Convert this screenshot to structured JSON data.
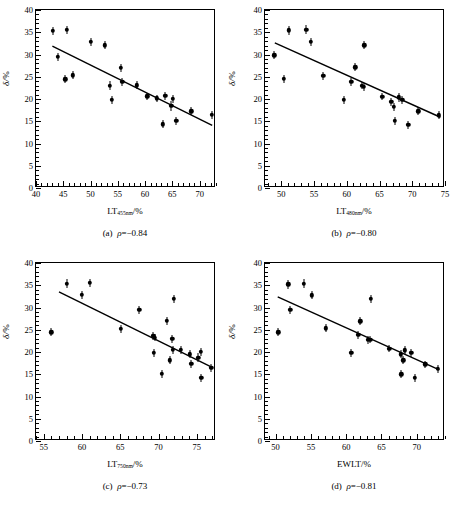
{
  "figure": {
    "type": "scatter-matrix",
    "panel_count": 4,
    "y_axis_label": "δ/",
    "y_axis_unit": "%"
  },
  "chart_data": [
    {
      "type": "scatter",
      "panel": "a",
      "title": "(a)",
      "caption_rho": "ρ",
      "caption_value": "=−0.84",
      "rho": -0.84,
      "xlabel_main": "LT",
      "xlabel_sub": "455nm",
      "xlabel_unit": "/%",
      "ylabel": "δ/%",
      "xlim": [
        40,
        73
      ],
      "ylim": [
        0,
        40
      ],
      "xticks": [
        40,
        45,
        50,
        55,
        60,
        65,
        70
      ],
      "yticks": [
        0,
        5,
        10,
        15,
        20,
        25,
        30,
        35,
        40
      ],
      "xminor_step": 1,
      "yminor_step": 1,
      "grid": false,
      "legend": "none",
      "fit_line": {
        "x1": 43.0,
        "y1": 31.9,
        "x2": 72.3,
        "y2": 14.1
      },
      "points": [
        {
          "x": 43.1,
          "y": 35.3,
          "err": 0.9
        },
        {
          "x": 44.0,
          "y": 29.5,
          "err": 0.9
        },
        {
          "x": 45.4,
          "y": 24.4,
          "err": 0.9
        },
        {
          "x": 45.6,
          "y": 35.5,
          "err": 1.0
        },
        {
          "x": 46.8,
          "y": 25.3,
          "err": 0.9
        },
        {
          "x": 50.0,
          "y": 32.9,
          "err": 0.9
        },
        {
          "x": 52.6,
          "y": 32.1,
          "err": 0.9
        },
        {
          "x": 53.5,
          "y": 23.0,
          "err": 1.0
        },
        {
          "x": 53.9,
          "y": 19.8,
          "err": 0.9
        },
        {
          "x": 55.6,
          "y": 27.0,
          "err": 0.9
        },
        {
          "x": 55.8,
          "y": 23.8,
          "err": 0.9
        },
        {
          "x": 58.5,
          "y": 23.1,
          "err": 0.9
        },
        {
          "x": 60.4,
          "y": 20.6,
          "err": 0.8
        },
        {
          "x": 62.2,
          "y": 20.2,
          "err": 0.8
        },
        {
          "x": 63.3,
          "y": 14.3,
          "err": 0.9
        },
        {
          "x": 63.7,
          "y": 20.7,
          "err": 0.9
        },
        {
          "x": 64.8,
          "y": 18.5,
          "err": 1.1
        },
        {
          "x": 65.1,
          "y": 20.0,
          "err": 0.9
        },
        {
          "x": 65.7,
          "y": 15.1,
          "err": 0.9
        },
        {
          "x": 68.5,
          "y": 17.2,
          "err": 0.9
        },
        {
          "x": 72.2,
          "y": 16.4,
          "err": 0.9
        }
      ]
    },
    {
      "type": "scatter",
      "panel": "b",
      "title": "(b)",
      "caption_rho": "ρ",
      "caption_value": "=−0.80",
      "rho": -0.8,
      "xlabel_main": "LT",
      "xlabel_sub": "480nm",
      "xlabel_unit": "/%",
      "ylabel": "δ/%",
      "xlim": [
        47.5,
        75
      ],
      "ylim": [
        0,
        40
      ],
      "xticks": [
        50,
        55,
        60,
        65,
        70,
        75
      ],
      "yticks": [
        0,
        5,
        10,
        15,
        20,
        25,
        30,
        35,
        40
      ],
      "xminor_step": 1,
      "yminor_step": 1,
      "grid": false,
      "legend": "none",
      "fit_line": {
        "x1": 49.0,
        "y1": 32.6,
        "x2": 74.3,
        "y2": 15.9
      },
      "points": [
        {
          "x": 48.9,
          "y": 29.8,
          "err": 0.9
        },
        {
          "x": 50.4,
          "y": 24.5,
          "err": 0.9
        },
        {
          "x": 51.1,
          "y": 35.4,
          "err": 1.0
        },
        {
          "x": 53.8,
          "y": 35.6,
          "err": 1.0
        },
        {
          "x": 54.5,
          "y": 32.8,
          "err": 0.9
        },
        {
          "x": 56.4,
          "y": 25.2,
          "err": 0.9
        },
        {
          "x": 59.5,
          "y": 19.8,
          "err": 0.9
        },
        {
          "x": 60.7,
          "y": 23.9,
          "err": 0.9
        },
        {
          "x": 61.3,
          "y": 27.1,
          "err": 0.9
        },
        {
          "x": 62.3,
          "y": 23.0,
          "err": 0.8
        },
        {
          "x": 62.6,
          "y": 22.7,
          "err": 0.9
        },
        {
          "x": 62.7,
          "y": 32.1,
          "err": 0.9
        },
        {
          "x": 65.4,
          "y": 20.5,
          "err": 0.8
        },
        {
          "x": 66.8,
          "y": 19.4,
          "err": 0.9
        },
        {
          "x": 67.2,
          "y": 18.2,
          "err": 0.9
        },
        {
          "x": 67.3,
          "y": 15.1,
          "err": 0.9
        },
        {
          "x": 67.9,
          "y": 20.4,
          "err": 1.0
        },
        {
          "x": 68.5,
          "y": 19.8,
          "err": 0.9
        },
        {
          "x": 69.4,
          "y": 14.2,
          "err": 0.9
        },
        {
          "x": 70.9,
          "y": 17.2,
          "err": 0.9
        },
        {
          "x": 74.1,
          "y": 16.3,
          "err": 0.9
        }
      ]
    },
    {
      "type": "scatter",
      "panel": "c",
      "title": "(c)",
      "caption_rho": "ρ",
      "caption_value": "=−0.73",
      "rho": -0.73,
      "xlabel_main": "LT",
      "xlabel_sub": "750nm",
      "xlabel_unit": "/%",
      "ylabel": "δ/%",
      "xlim": [
        54,
        77.5
      ],
      "ylim": [
        0,
        40
      ],
      "xticks": [
        55,
        60,
        65,
        70,
        75
      ],
      "yticks": [
        0,
        5,
        10,
        15,
        20,
        25,
        30,
        35,
        40
      ],
      "xminor_step": 1,
      "yminor_step": 1,
      "grid": false,
      "legend": "none",
      "fit_line": {
        "x1": 57.0,
        "y1": 33.5,
        "x2": 76.8,
        "y2": 16.7
      },
      "points": [
        {
          "x": 56.0,
          "y": 24.4,
          "err": 0.9
        },
        {
          "x": 58.0,
          "y": 35.3,
          "err": 1.0
        },
        {
          "x": 60.0,
          "y": 32.8,
          "err": 0.9
        },
        {
          "x": 61.0,
          "y": 35.5,
          "err": 1.0
        },
        {
          "x": 65.1,
          "y": 25.2,
          "err": 0.9
        },
        {
          "x": 67.5,
          "y": 29.5,
          "err": 0.9
        },
        {
          "x": 69.3,
          "y": 23.6,
          "err": 1.0
        },
        {
          "x": 69.4,
          "y": 19.8,
          "err": 0.9
        },
        {
          "x": 69.5,
          "y": 23.2,
          "err": 0.8
        },
        {
          "x": 70.4,
          "y": 15.1,
          "err": 0.9
        },
        {
          "x": 71.1,
          "y": 27.0,
          "err": 0.9
        },
        {
          "x": 71.5,
          "y": 18.1,
          "err": 0.9
        },
        {
          "x": 71.8,
          "y": 23.0,
          "err": 0.9
        },
        {
          "x": 71.9,
          "y": 20.5,
          "err": 0.9
        },
        {
          "x": 72.0,
          "y": 32.0,
          "err": 0.9
        },
        {
          "x": 72.9,
          "y": 20.5,
          "err": 0.9
        },
        {
          "x": 74.1,
          "y": 19.5,
          "err": 0.9
        },
        {
          "x": 74.3,
          "y": 17.4,
          "err": 0.9
        },
        {
          "x": 75.2,
          "y": 18.7,
          "err": 1.0
        },
        {
          "x": 75.5,
          "y": 20.1,
          "err": 0.9
        },
        {
          "x": 75.6,
          "y": 14.2,
          "err": 0.9
        },
        {
          "x": 76.9,
          "y": 16.4,
          "err": 0.9
        }
      ]
    },
    {
      "type": "scatter",
      "panel": "d",
      "title": "(d)",
      "caption_rho": "ρ",
      "caption_value": "=−0.81",
      "rho": -0.81,
      "xlabel_main": "EWLT",
      "xlabel_sub": "",
      "xlabel_unit": "/%",
      "ylabel": "δ/%",
      "xlim": [
        48.5,
        74
      ],
      "ylim": [
        0,
        40
      ],
      "xticks": [
        50,
        55,
        60,
        65,
        70
      ],
      "yticks": [
        0,
        5,
        10,
        15,
        20,
        25,
        30,
        35,
        40
      ],
      "xminor_step": 1,
      "yminor_step": 1,
      "grid": false,
      "legend": "none",
      "fit_line": {
        "x1": 50.3,
        "y1": 32.4,
        "x2": 73.2,
        "y2": 16.0
      },
      "points": [
        {
          "x": 50.4,
          "y": 24.4,
          "err": 0.9
        },
        {
          "x": 51.8,
          "y": 35.2,
          "err": 1.0
        },
        {
          "x": 52.1,
          "y": 29.5,
          "err": 0.9
        },
        {
          "x": 54.0,
          "y": 35.3,
          "err": 1.0
        },
        {
          "x": 55.1,
          "y": 32.7,
          "err": 0.9
        },
        {
          "x": 57.1,
          "y": 25.3,
          "err": 0.9
        },
        {
          "x": 60.7,
          "y": 19.8,
          "err": 0.9
        },
        {
          "x": 61.7,
          "y": 23.9,
          "err": 0.9
        },
        {
          "x": 62.0,
          "y": 26.9,
          "err": 0.9
        },
        {
          "x": 63.1,
          "y": 22.8,
          "err": 0.9
        },
        {
          "x": 63.4,
          "y": 22.8,
          "err": 0.8
        },
        {
          "x": 63.5,
          "y": 32.0,
          "err": 0.9
        },
        {
          "x": 66.1,
          "y": 20.7,
          "err": 0.8
        },
        {
          "x": 67.7,
          "y": 19.5,
          "err": 0.9
        },
        {
          "x": 67.8,
          "y": 15.0,
          "err": 0.9
        },
        {
          "x": 68.1,
          "y": 18.1,
          "err": 0.9
        },
        {
          "x": 68.3,
          "y": 20.4,
          "err": 0.9
        },
        {
          "x": 69.2,
          "y": 19.8,
          "err": 0.9
        },
        {
          "x": 69.7,
          "y": 14.2,
          "err": 0.9
        },
        {
          "x": 71.2,
          "y": 17.2,
          "err": 0.8
        },
        {
          "x": 73.0,
          "y": 16.2,
          "err": 0.9
        }
      ]
    }
  ]
}
